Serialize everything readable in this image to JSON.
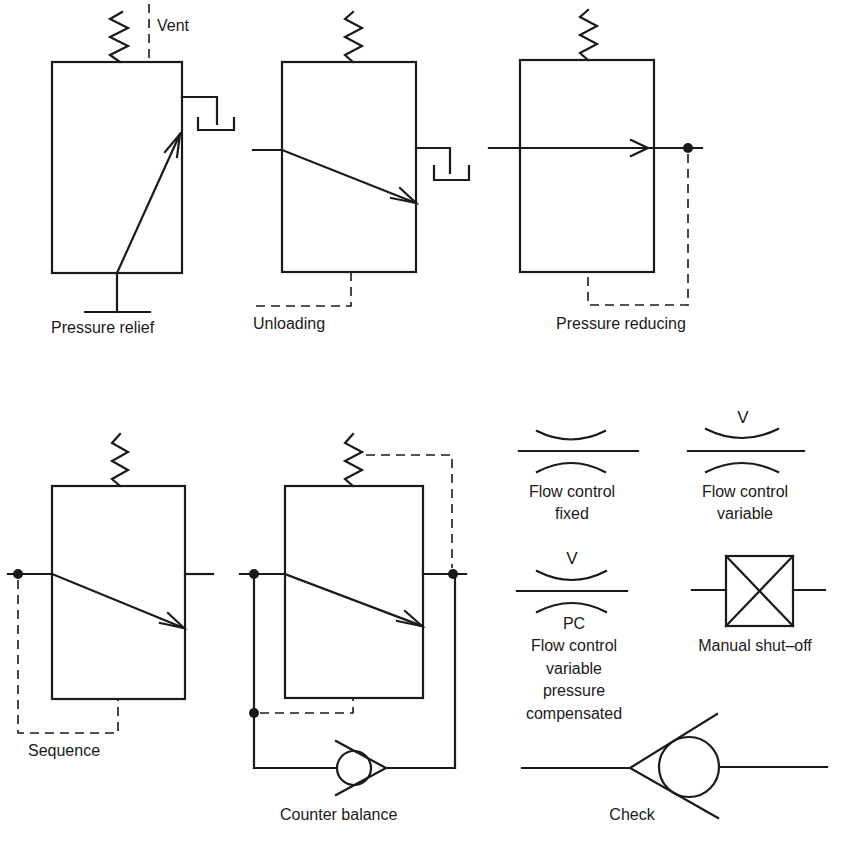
{
  "symbols": {
    "pressure_relief": {
      "label": "Pressure relief",
      "vent_label": "Vent"
    },
    "unloading": {
      "label": "Unloading"
    },
    "pressure_reducing": {
      "label": "Pressure reducing"
    },
    "sequence": {
      "label": "Sequence"
    },
    "counter_balance": {
      "label": "Counter balance"
    },
    "flow_control_fixed": {
      "label_line1": "Flow control",
      "label_line2": "fixed"
    },
    "flow_control_variable": {
      "marker": "V",
      "label_line1": "Flow control",
      "label_line2": "variable"
    },
    "flow_control_pc": {
      "marker_top": "V",
      "marker_bottom": "PC",
      "label_line1": "Flow control",
      "label_line2": "variable",
      "label_line3": "pressure",
      "label_line4": "compensated"
    },
    "manual_shutoff": {
      "label": "Manual shut–off"
    },
    "check": {
      "label": "Check"
    }
  },
  "colors": {
    "ink": "#1a1a1a",
    "paper": "#ffffff"
  }
}
